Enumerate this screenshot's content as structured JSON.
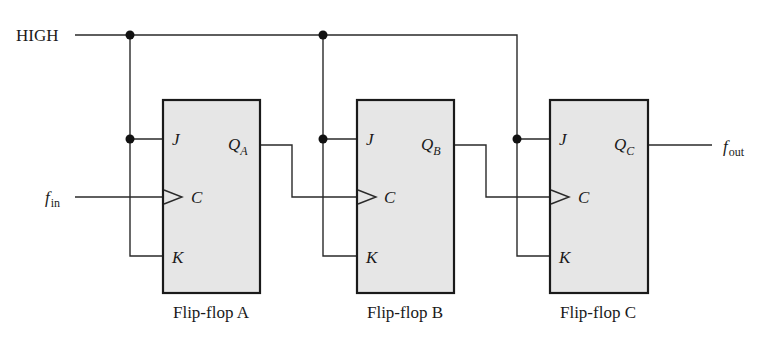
{
  "diagram": {
    "type": "3-bit JK flip-flop frequency divider circuit",
    "signals": {
      "high_label": "HIGH",
      "input_label_main": "f",
      "input_label_sub": "in",
      "output_label_main": "f",
      "output_label_sub": "out"
    },
    "flip_flops": [
      {
        "caption": "Flip-flop A",
        "pin_j": "J",
        "pin_c": "C",
        "pin_k": "K",
        "q_main": "Q",
        "q_sub": "A"
      },
      {
        "caption": "Flip-flop B",
        "pin_j": "J",
        "pin_c": "C",
        "pin_k": "K",
        "q_main": "Q",
        "q_sub": "B"
      },
      {
        "caption": "Flip-flop C",
        "pin_j": "J",
        "pin_c": "C",
        "pin_k": "K",
        "q_main": "Q",
        "q_sub": "C"
      }
    ],
    "colors": {
      "wire": "#2a2a2a",
      "box_fill": "#e6e6e6",
      "box_stroke": "#1a1a1a",
      "junction": "#111111"
    }
  }
}
